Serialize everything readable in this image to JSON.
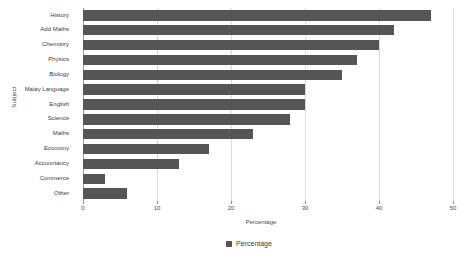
{
  "chart_data": {
    "type": "bar",
    "orientation": "horizontal",
    "title": "",
    "xlabel": "Percentage",
    "ylabel": "Subject",
    "xlim": [
      0,
      50
    ],
    "xticks": [
      0,
      10,
      20,
      30,
      40,
      50
    ],
    "grid": true,
    "legend_position": "bottom",
    "categories": [
      "History",
      "Add Maths",
      "Chemistry",
      "Physics",
      "Biology",
      "Malay Language",
      "English",
      "Science",
      "Maths",
      "Economy",
      "Accountancy",
      "Commerce",
      "Other"
    ],
    "series": [
      {
        "name": "Percentage",
        "color": "#555555",
        "values": [
          47,
          42,
          40,
          37,
          35,
          30,
          30,
          28,
          23,
          17,
          13,
          3,
          6
        ]
      }
    ]
  },
  "legend": {
    "entries": [
      {
        "label": "Percentage",
        "color": "#555555"
      }
    ]
  },
  "style": {
    "bar_color": "#555555",
    "grid_color": "#d9d9d9",
    "axis_color": "#9a9a9a",
    "background": "#ffffff",
    "text_color": "#3d3d3d"
  }
}
